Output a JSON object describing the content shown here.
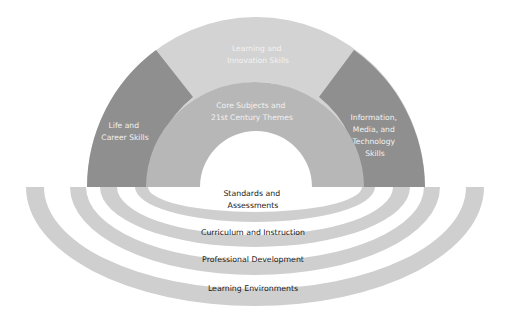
{
  "diagram": {
    "type": "framework-rainbow",
    "colors": {
      "outer_dark_segment": "#8f8f8f",
      "outer_light_segment": "#d3d3d3",
      "core_ring": "#b7b7b7",
      "support_rings": "#cfcfcf",
      "arch_text": "#f2f2f2",
      "ring_text": "#1a1a1a",
      "background": "#ffffff"
    },
    "outcomes": {
      "left": {
        "lines": [
          "Life and",
          "Career Skills"
        ]
      },
      "top": {
        "lines": [
          "Learning and",
          "Innovation Skills"
        ]
      },
      "right": {
        "lines": [
          "Information,",
          "Media, and",
          "Technology",
          "Skills"
        ]
      },
      "core": {
        "lines": [
          "Core Subjects and",
          "21st Century Themes"
        ]
      }
    },
    "support_systems": [
      {
        "lines": [
          "Standards and",
          "Assessments"
        ]
      },
      {
        "lines": [
          "Curriculum and Instruction"
        ]
      },
      {
        "lines": [
          "Professional Development"
        ]
      },
      {
        "lines": [
          "Learning Environments"
        ]
      }
    ]
  }
}
